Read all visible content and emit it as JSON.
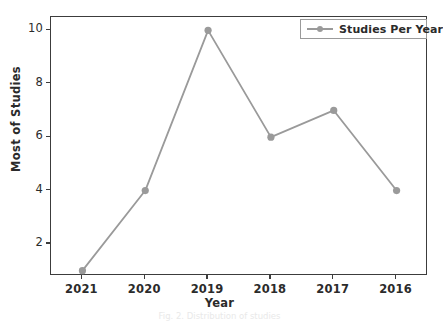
{
  "chart_data": {
    "type": "line",
    "title": "",
    "xlabel": "Year",
    "ylabel": "Most of Studies",
    "categories": [
      "2021",
      "2020",
      "2019",
      "2018",
      "2017",
      "2016"
    ],
    "series": [
      {
        "name": "Studies Per Year",
        "values": [
          1,
          4,
          10,
          6,
          7,
          4
        ]
      }
    ],
    "yticks": [
      "2",
      "4",
      "6",
      "8",
      "10"
    ],
    "ytick_values": [
      2,
      4,
      6,
      8,
      10
    ],
    "ylim": [
      0.8,
      10.5
    ],
    "grid": false,
    "legend_position": "upper right",
    "line_color": "#9a9a9a",
    "marker_color": "#9a9a9a",
    "marker": "circle",
    "axes_color": "#3c3c3c",
    "background": "#ffffff"
  },
  "legend": {
    "entries": [
      "Studies Per Year"
    ]
  },
  "caption": {
    "text": "Fig. 2. Distribution of studies"
  }
}
